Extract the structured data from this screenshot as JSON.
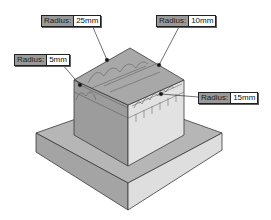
{
  "diagram": {
    "type": "isometric-fillet-radius-callouts",
    "colors": {
      "top_face": "#a8a8a8",
      "left_face": "#9c9c9c",
      "right_face": "#e2e2e2",
      "base_top": "#b6b6b6",
      "base_left": "#a4a4a4",
      "base_right": "#dedede",
      "edge": "#3a3a3a",
      "label_key_bg": "#9a9a9a",
      "label_val_bg": "#ffffff"
    },
    "callouts": [
      {
        "key": "Radius:",
        "value": "25mm"
      },
      {
        "key": "Radius:",
        "value": "10mm"
      },
      {
        "key": "Radius:",
        "value": "5mm"
      },
      {
        "key": "Radius:",
        "value": "15mm"
      }
    ]
  }
}
